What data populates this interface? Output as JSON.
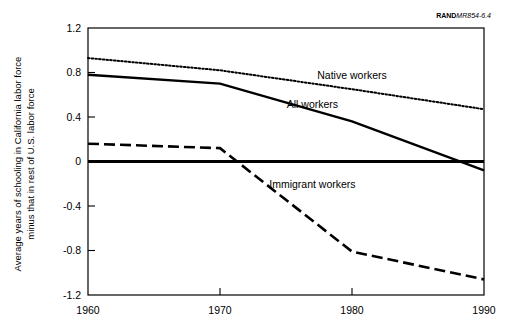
{
  "credit": {
    "brand": "RAND",
    "code": "MR854-6.4"
  },
  "chart_data": {
    "type": "line",
    "title": "",
    "subtitle": "",
    "xlabel": "",
    "ylabel_line1": "Average years of schooling in California labor force",
    "ylabel_line2": "minus that in rest of U.S. labor force",
    "x": [
      1960,
      1970,
      1980,
      1990
    ],
    "xticklabels": [
      "1960",
      "1970",
      "1980",
      "1990"
    ],
    "xlim": [
      1960,
      1990
    ],
    "ylim": [
      -1.2,
      1.2
    ],
    "yticks": [
      1.2,
      0.8,
      0.4,
      0,
      -0.4,
      -0.8,
      -1.2
    ],
    "yticklabels": [
      "1.2",
      "0.8",
      "0.4",
      "0",
      "-0.4",
      "-0.8",
      "-1.2"
    ],
    "grid": false,
    "legend_position": "inline-annotations",
    "zero_line": 0,
    "series": [
      {
        "name": "Native workers",
        "style": "dotted",
        "values": [
          0.93,
          0.82,
          0.65,
          0.47
        ],
        "label_x": 1980,
        "label_y": 0.78
      },
      {
        "name": "All workers",
        "style": "solid",
        "values": [
          0.78,
          0.7,
          0.36,
          -0.08
        ],
        "label_x": 1977,
        "label_y": 0.52
      },
      {
        "name": "Immigrant workers",
        "style": "dashed",
        "values": [
          0.16,
          0.12,
          -0.81,
          -1.06
        ],
        "label_x": 1977,
        "label_y": -0.2
      }
    ]
  }
}
